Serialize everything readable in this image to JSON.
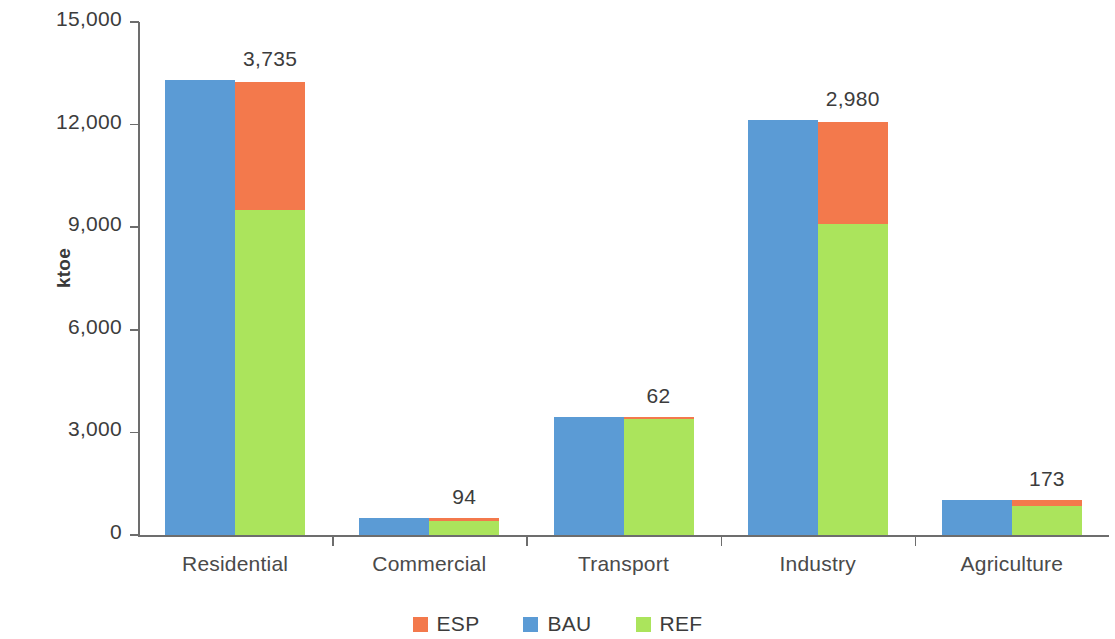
{
  "chart_data": {
    "type": "bar",
    "subtype": "grouped-stacked",
    "title": "",
    "xlabel": "",
    "ylabel": "ktoe",
    "ylim": [
      0,
      15000
    ],
    "ytick_values": [
      15000,
      12000,
      9000,
      6000,
      3000,
      0
    ],
    "ytick_labels": [
      "15,000",
      "12,000",
      "9,000",
      "6,000",
      "3,000",
      "0"
    ],
    "grid": false,
    "legend_position": "bottom",
    "categories": [
      "Residential",
      "Commercial",
      "Transport",
      "Industry",
      "Agriculture"
    ],
    "series": [
      {
        "name": "BAU",
        "color": "#5B9BD5",
        "stack": "bau",
        "values": [
          13305,
          500,
          3450,
          12130,
          1025
        ]
      },
      {
        "name": "REF",
        "color": "#ABE45C",
        "stack": "ref",
        "values": [
          9503,
          403,
          3388,
          9090,
          850
        ]
      },
      {
        "name": "ESP",
        "color": "#F3794C",
        "stack": "ref",
        "values": [
          3735,
          94,
          62,
          2980,
          173
        ]
      }
    ],
    "annotations": [
      {
        "category": "Residential",
        "text": "3,735",
        "series": "ESP"
      },
      {
        "category": "Commercial",
        "text": "94",
        "series": "ESP"
      },
      {
        "category": "Transport",
        "text": "62",
        "series": "ESP"
      },
      {
        "category": "Industry",
        "text": "2,980",
        "series": "ESP"
      },
      {
        "category": "Agriculture",
        "text": "173",
        "series": "ESP"
      }
    ]
  },
  "axis": {
    "y_title": "ktoe",
    "y_ticks": [
      {
        "label": "15,000",
        "value": 15000
      },
      {
        "label": "12,000",
        "value": 12000
      },
      {
        "label": "9,000",
        "value": 9000
      },
      {
        "label": "6,000",
        "value": 6000
      },
      {
        "label": "3,000",
        "value": 3000
      },
      {
        "label": "0",
        "value": 0
      }
    ]
  },
  "categories": [
    {
      "label": "Residential",
      "value_label": "3,735",
      "bau": 13305,
      "ref": 9503,
      "esp": 3735
    },
    {
      "label": "Commercial",
      "value_label": "94",
      "bau": 500,
      "ref": 403,
      "esp": 94
    },
    {
      "label": "Transport",
      "value_label": "62",
      "bau": 3450,
      "ref": 3388,
      "esp": 62
    },
    {
      "label": "Industry",
      "value_label": "2,980",
      "bau": 12130,
      "ref": 9090,
      "esp": 2980
    },
    {
      "label": "Agriculture",
      "value_label": "173",
      "bau": 1025,
      "ref": 850,
      "esp": 173
    }
  ],
  "legend": {
    "items": [
      {
        "label": "ESP",
        "color": "#F3794C"
      },
      {
        "label": "BAU",
        "color": "#5B9BD5"
      },
      {
        "label": "REF",
        "color": "#ABE45C"
      }
    ]
  },
  "colors": {
    "esp": "#F3794C",
    "bau": "#5B9BD5",
    "ref": "#ABE45C",
    "axis": "#6d6d6d",
    "text": "#3c3c3c",
    "background": "#ffffff"
  }
}
